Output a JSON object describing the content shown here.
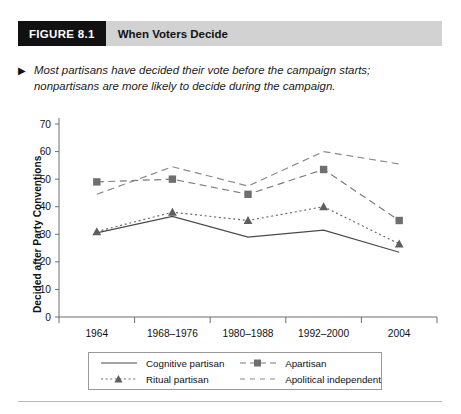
{
  "header": {
    "figure_tag": "FIGURE 8.1",
    "title": "When Voters Decide"
  },
  "caption": {
    "bullet": "▶",
    "text": "Most partisans have decided their vote before the campaign starts; nonpartisans are more likely to decide during the campaign."
  },
  "chart_data": {
    "type": "line",
    "title": "When Voters Decide",
    "xlabel": "",
    "ylabel": "Decided after Party Conventions",
    "categories": [
      "1964",
      "1968–1976",
      "1980–1988",
      "1992–2000",
      "2004"
    ],
    "ylim": [
      0,
      70
    ],
    "yticks": [
      "0",
      "10",
      "20",
      "30",
      "40",
      "50",
      "60",
      "70"
    ],
    "grid": false,
    "legend_position": "bottom",
    "series": [
      {
        "name": "Cognitive partisan",
        "line_style": "solid",
        "marker": "none",
        "color": "#4a4a4a",
        "values": [
          30.5,
          36.5,
          29,
          31.5,
          23.5
        ]
      },
      {
        "name": "Apartisan",
        "line_style": "dashed",
        "marker": "square",
        "color": "#7d7d7d",
        "values": [
          49,
          50,
          44.5,
          53.5,
          35
        ]
      },
      {
        "name": "Ritual partisan",
        "line_style": "dotted",
        "marker": "triangle",
        "color": "#6b6b6b",
        "values": [
          31,
          38,
          35,
          40,
          26.5
        ]
      },
      {
        "name": "Apolitical independent",
        "line_style": "dashed",
        "marker": "none",
        "color": "#8a8a8a",
        "values": [
          44.5,
          54.5,
          47.5,
          60,
          55.5
        ]
      }
    ]
  },
  "legend": {
    "items": [
      {
        "label": "Cognitive partisan"
      },
      {
        "label": "Apartisan"
      },
      {
        "label": "Ritual partisan"
      },
      {
        "label": "Apolitical independent"
      }
    ]
  }
}
